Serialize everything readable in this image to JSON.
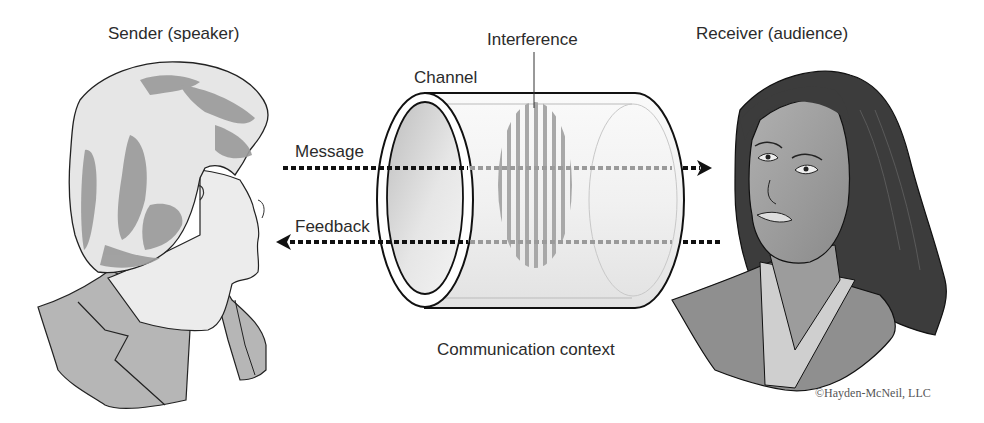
{
  "diagram": {
    "labels": {
      "sender": "Sender (speaker)",
      "receiver": "Receiver (audience)",
      "interference": "Interference",
      "channel": "Channel",
      "message": "Message",
      "feedback": "Feedback",
      "context": "Communication context"
    },
    "copyright": "©Hayden-McNeil, LLC",
    "nodes": [
      {
        "id": "sender",
        "label": "Sender (speaker)",
        "depiction": "older woman in profile facing right"
      },
      {
        "id": "channel",
        "label": "Channel",
        "depiction": "transparent cylinder"
      },
      {
        "id": "interference",
        "label": "Interference",
        "depiction": "vertical gray stripes inside channel"
      },
      {
        "id": "receiver",
        "label": "Receiver (audience)",
        "depiction": "younger woman with long dark hair facing left"
      }
    ],
    "edges": [
      {
        "from": "sender",
        "to": "receiver",
        "label": "Message",
        "style": "dotted arrow"
      },
      {
        "from": "receiver",
        "to": "sender",
        "label": "Feedback",
        "style": "dotted arrow"
      }
    ],
    "colors": {
      "line": "#111111",
      "hair_light": "#e6e6e6",
      "hair_shade": "#9a9a9a",
      "jacket": "#b4b4b4",
      "skin_sender": "#ececec",
      "skin_receiver": "#9c9c9c",
      "hair_dark": "#3c3c3c",
      "interference": "#a8a8a8"
    }
  }
}
